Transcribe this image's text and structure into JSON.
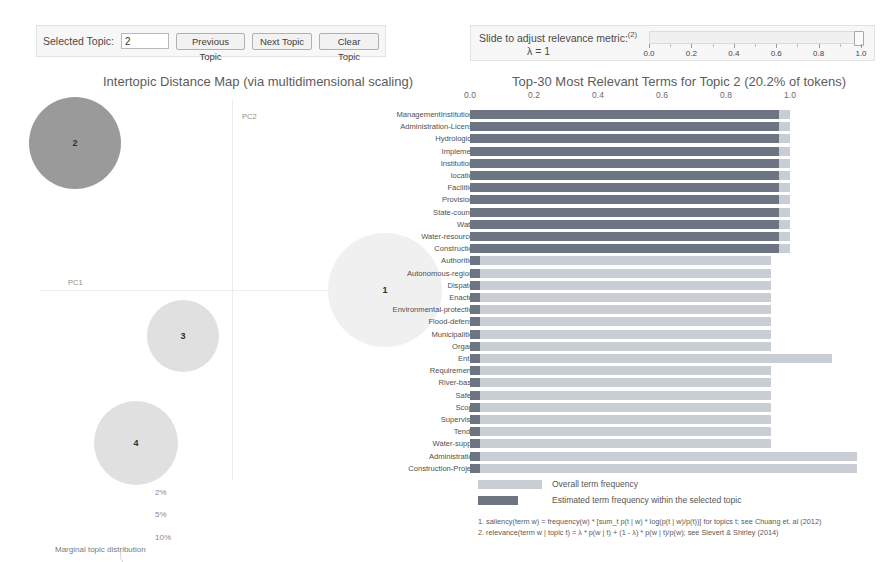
{
  "toolbar": {
    "selected_topic_label": "Selected Topic:",
    "selected_topic_value": "2",
    "previous_topic_label": "Previous Topic",
    "next_topic_label": "Next Topic",
    "clear_topic_label": "Clear Topic"
  },
  "lambda_control": {
    "title": "Slide to adjust relevance metric:",
    "title_sup": "(2)",
    "value_label": "λ = 1",
    "lambda_value": 1.0,
    "tick_labels": [
      "0.0",
      "0.2",
      "0.4",
      "0.6",
      "0.8",
      "1.0"
    ],
    "tick_values": [
      0.0,
      0.2,
      0.4,
      0.6,
      0.8,
      1.0
    ]
  },
  "left_panel": {
    "title": "Intertopic Distance Map (via multidimensional scaling)",
    "axis_x_label": "PC1",
    "axis_y_label": "PC2",
    "marginal_label": "Marginal topic distribution",
    "size_legend": [
      "2%",
      "5%",
      "10%"
    ],
    "topics": [
      {
        "id": "2",
        "cx": 75,
        "cy": 53,
        "r": 46,
        "selected": true
      },
      {
        "id": "1",
        "cx": 385,
        "cy": 200,
        "r": 57,
        "selected": false
      },
      {
        "id": "3",
        "cx": 183,
        "cy": 246,
        "r": 36,
        "selected": false
      },
      {
        "id": "4",
        "cx": 136,
        "cy": 353,
        "r": 42,
        "selected": false
      }
    ]
  },
  "right_panel": {
    "title": "Top-30 Most Relevant Terms for Topic 2 (20.2% of tokens)"
  },
  "legend": {
    "overall_label": "Overall term frequency",
    "estimated_label": "Estimated term frequency within the selected topic",
    "footnote_1": "1. saliency(term w) = frequency(w) * [sum_t p(t | w) * log(p(t | w)/p(t))] for topics t; see Chuang et. al (2012)",
    "footnote_2": "2. relevance(term w | topic t) = λ * p(w | t) + (1 - λ) * p(w | t)/p(w); see Sievert & Shirley (2014)"
  },
  "chart_data": {
    "type": "bar",
    "title": "Top-30 Most Relevant Terms for Topic 2 (20.2% of tokens)",
    "xlabel": "",
    "ylabel": "",
    "xlim": [
      0.0,
      1.0
    ],
    "grid": true,
    "legend_position": "bottom",
    "orientation": "horizontal",
    "categories": [
      "ManagementInstitutions",
      "Administration-License",
      "Hydrological",
      "Implement",
      "Institutions",
      "location",
      "Facilities",
      "Provisions",
      "State-council",
      "Water",
      "Water-resources",
      "Construction",
      "Authorities",
      "Autonomous-regions",
      "Dispatch",
      "Enacted",
      "Environmental-protection",
      "Flood-defense",
      "Municipalities",
      "Organs",
      "Entity",
      "Requirements",
      "River-basin",
      "Safety",
      "Scope",
      "Supervisor",
      "Tender",
      "Water-supply",
      "Administration",
      "Construction-Project"
    ],
    "series": [
      {
        "name": "Overall term frequency",
        "color": "#c9cdd4",
        "values": [
          1.0,
          1.0,
          1.0,
          1.0,
          1.0,
          1.0,
          1.0,
          1.0,
          1.0,
          1.0,
          1.0,
          1.0,
          0.94,
          0.94,
          0.94,
          0.94,
          0.94,
          0.94,
          0.94,
          0.94,
          1.13,
          0.94,
          0.94,
          0.94,
          0.94,
          0.94,
          0.94,
          0.94,
          1.21,
          1.21
        ]
      },
      {
        "name": "Estimated term frequency within the selected topic",
        "color": "#6d7583",
        "values": [
          0.965,
          0.965,
          0.965,
          0.965,
          0.965,
          0.965,
          0.965,
          0.965,
          0.965,
          0.965,
          0.965,
          0.965,
          0.03,
          0.03,
          0.03,
          0.03,
          0.03,
          0.03,
          0.03,
          0.03,
          0.03,
          0.03,
          0.03,
          0.03,
          0.03,
          0.03,
          0.03,
          0.03,
          0.03,
          0.03
        ]
      }
    ]
  }
}
